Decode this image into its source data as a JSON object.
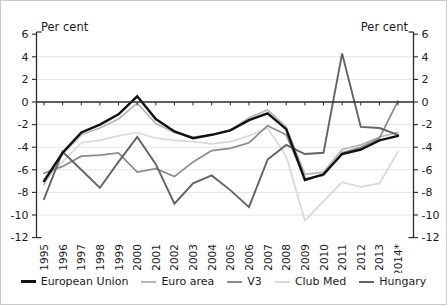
{
  "chart_data": {
    "type": "line",
    "title": "",
    "ylabel_left": "Per cent",
    "ylabel_right": "Per cent",
    "ylim": [
      -12,
      6
    ],
    "ytick_step": 2,
    "yticks": [
      6,
      4,
      2,
      0,
      -2,
      -4,
      -6,
      -8,
      -10,
      -12
    ],
    "grid": "horizontal-light",
    "legend_position": "bottom",
    "x": [
      "1995",
      "1996",
      "1997",
      "1998",
      "1999",
      "2000",
      "2001",
      "2002",
      "2003",
      "2004",
      "2005",
      "2006",
      "2007",
      "2008",
      "2009",
      "2010",
      "2011",
      "2012",
      "2013",
      "2014*"
    ],
    "series": [
      {
        "name": "European Union",
        "color": "#111111",
        "width": 2.4,
        "values": [
          -7.0,
          -4.5,
          -2.7,
          -2.0,
          -1.1,
          0.5,
          -1.5,
          -2.6,
          -3.2,
          -2.9,
          -2.5,
          -1.6,
          -1.0,
          -2.4,
          -6.9,
          -6.4,
          -4.6,
          -4.2,
          -3.4,
          -3.0
        ]
      },
      {
        "name": "Euro area",
        "color": "#b5b5b5",
        "width": 1.7,
        "values": [
          -7.3,
          -4.6,
          -2.9,
          -2.3,
          -1.5,
          -0.1,
          -1.9,
          -2.7,
          -3.1,
          -2.9,
          -2.5,
          -1.4,
          -0.7,
          -2.2,
          -6.4,
          -6.2,
          -4.2,
          -3.8,
          -3.1,
          -2.7
        ]
      },
      {
        "name": "V3",
        "color": "#8a8a8a",
        "width": 1.7,
        "values": [
          -6.3,
          -5.7,
          -4.8,
          -4.7,
          -4.5,
          -6.2,
          -5.9,
          -6.6,
          -5.3,
          -4.3,
          -4.1,
          -3.6,
          -2.1,
          -2.9,
          -6.8,
          -6.5,
          -4.5,
          -4.0,
          -3.2,
          0.1
        ]
      },
      {
        "name": "Club Med",
        "color": "#d9d9d9",
        "width": 1.7,
        "values": [
          -6.8,
          -5.3,
          -3.6,
          -3.4,
          -3.0,
          -2.7,
          -3.2,
          -3.4,
          -3.5,
          -3.7,
          -3.5,
          -3.0,
          -2.3,
          -4.8,
          -10.5,
          -8.8,
          -7.1,
          -7.5,
          -7.2,
          -4.4
        ]
      },
      {
        "name": "Hungary",
        "color": "#636363",
        "width": 1.9,
        "values": [
          -8.6,
          -4.4,
          -6.0,
          -7.6,
          -5.3,
          -3.1,
          -5.5,
          -9.0,
          -7.2,
          -6.5,
          -7.8,
          -9.3,
          -5.1,
          -3.8,
          -4.6,
          -4.5,
          4.3,
          -2.2,
          -2.3,
          -2.9
        ]
      }
    ]
  }
}
